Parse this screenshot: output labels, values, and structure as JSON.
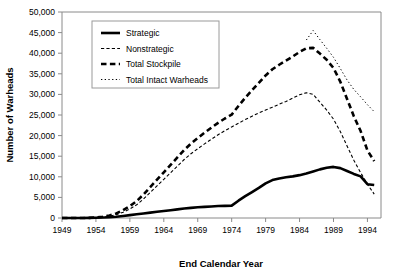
{
  "chart_data": {
    "type": "line",
    "title": "",
    "xlabel": "End Calendar Year",
    "ylabel": "Number of Warheads",
    "xlim": [
      1949,
      1996
    ],
    "ylim": [
      0,
      50000
    ],
    "grid": false,
    "legend_position": "top-left",
    "xticks": [
      "1949",
      "1954",
      "1959",
      "1964",
      "1969",
      "1974",
      "1979",
      "1984",
      "1989",
      "1994"
    ],
    "xtick_values": [
      1949,
      1954,
      1959,
      1964,
      1969,
      1974,
      1979,
      1984,
      1989,
      1994
    ],
    "yticks": [
      "0",
      "5,000",
      "10,000",
      "15,000",
      "20,000",
      "25,000",
      "30,000",
      "35,000",
      "40,000",
      "45,000",
      "50,000"
    ],
    "ytick_values": [
      0,
      5000,
      10000,
      15000,
      20000,
      25000,
      30000,
      35000,
      40000,
      45000,
      50000
    ],
    "x": [
      1949,
      1950,
      1951,
      1952,
      1953,
      1954,
      1955,
      1956,
      1957,
      1958,
      1959,
      1960,
      1961,
      1962,
      1963,
      1964,
      1965,
      1966,
      1967,
      1968,
      1969,
      1970,
      1971,
      1972,
      1973,
      1974,
      1975,
      1976,
      1977,
      1978,
      1979,
      1980,
      1981,
      1982,
      1983,
      1984,
      1985,
      1986,
      1987,
      1988,
      1989,
      1990,
      1991,
      1992,
      1993,
      1994,
      1995
    ],
    "series": [
      {
        "name": "Strategic",
        "style": "solid-thick",
        "values": [
          0,
          0,
          0,
          0,
          20,
          60,
          120,
          200,
          320,
          500,
          700,
          900,
          1100,
          1300,
          1500,
          1700,
          1900,
          2100,
          2300,
          2450,
          2600,
          2700,
          2800,
          2900,
          2950,
          3000,
          4200,
          5300,
          6300,
          7300,
          8400,
          9200,
          9600,
          9900,
          10100,
          10400,
          10800,
          11300,
          11800,
          12200,
          12400,
          12100,
          11400,
          10700,
          10100,
          8200,
          8000
        ]
      },
      {
        "name": "Nonstrategic",
        "style": "fine-dashed",
        "values": [
          0,
          0,
          0,
          0,
          20,
          80,
          200,
          420,
          800,
          1400,
          2200,
          3200,
          4600,
          6200,
          7800,
          9400,
          11000,
          12600,
          14200,
          15600,
          16800,
          18000,
          19100,
          20200,
          21200,
          22100,
          23000,
          23900,
          24700,
          25500,
          26200,
          26900,
          27600,
          28300,
          29100,
          29900,
          30400,
          30000,
          28100,
          26200,
          24000,
          21000,
          17500,
          14000,
          11000,
          8200,
          5800
        ]
      },
      {
        "name": "Total Stockpile",
        "style": "thick-dashed",
        "values": [
          0,
          0,
          0,
          0,
          40,
          140,
          320,
          620,
          1120,
          1900,
          2900,
          4100,
          5700,
          7500,
          9300,
          11100,
          12900,
          14700,
          16500,
          18050,
          19400,
          20700,
          21900,
          23100,
          24150,
          25100,
          27200,
          29200,
          31000,
          32800,
          34600,
          36100,
          37200,
          38200,
          39200,
          40300,
          41200,
          41300,
          39900,
          38400,
          36400,
          33100,
          28900,
          24700,
          21100,
          16400,
          13800
        ]
      },
      {
        "name": "Total Intact Warheads",
        "style": "dotted",
        "values": [
          null,
          null,
          null,
          null,
          null,
          null,
          null,
          null,
          null,
          null,
          null,
          null,
          null,
          null,
          null,
          null,
          null,
          null,
          null,
          null,
          null,
          null,
          null,
          null,
          null,
          null,
          null,
          null,
          null,
          null,
          null,
          null,
          null,
          null,
          null,
          null,
          43200,
          45500,
          43300,
          41200,
          39000,
          36300,
          33500,
          31200,
          29400,
          27500,
          25800
        ]
      }
    ]
  },
  "legend": {
    "items": [
      {
        "label": "Strategic",
        "style": "solid-thick"
      },
      {
        "label": "Nonstrategic",
        "style": "fine-dashed"
      },
      {
        "label": "Total Stockpile",
        "style": "thick-dashed"
      },
      {
        "label": "Total Intact Warheads",
        "style": "dotted"
      }
    ]
  },
  "axes": {
    "x_title": "End Calendar Year",
    "y_title": "Number of Warheads"
  }
}
